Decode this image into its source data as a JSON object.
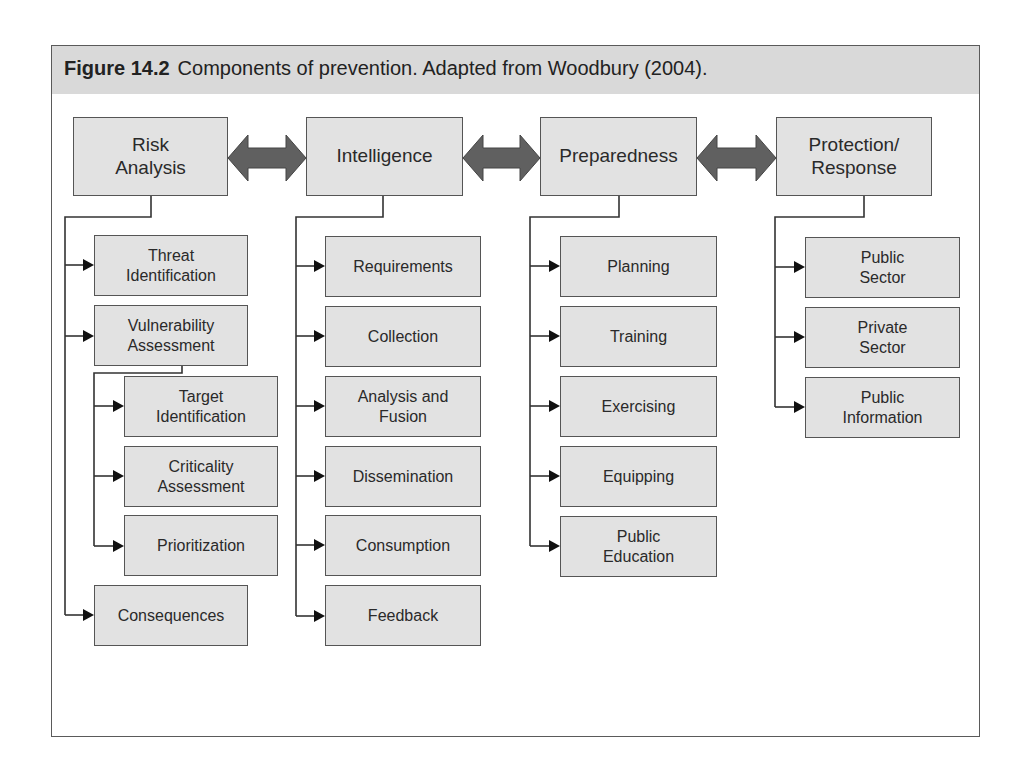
{
  "figure": {
    "number": "Figure 14.2",
    "caption": "Components of prevention. Adapted from Woodbury (2004)."
  },
  "colors": {
    "box_fill": "#e2e2e2",
    "box_border": "#555555",
    "arrow_fill": "#606060",
    "caption_band": "#d9d9d9"
  },
  "columns": [
    {
      "title": "Risk\nAnalysis",
      "children": [
        {
          "label": "Threat\nIdentification"
        },
        {
          "label": "Vulnerability\nAssessment",
          "children": [
            {
              "label": "Target\nIdentification"
            },
            {
              "label": "Criticality\nAssessment"
            },
            {
              "label": "Prioritization"
            }
          ]
        },
        {
          "label": "Consequences"
        }
      ]
    },
    {
      "title": "Intelligence",
      "children": [
        {
          "label": "Requirements"
        },
        {
          "label": "Collection"
        },
        {
          "label": "Analysis and\nFusion"
        },
        {
          "label": "Dissemination"
        },
        {
          "label": "Consumption"
        },
        {
          "label": "Feedback"
        }
      ]
    },
    {
      "title": "Preparedness",
      "children": [
        {
          "label": "Planning"
        },
        {
          "label": "Training"
        },
        {
          "label": "Exercising"
        },
        {
          "label": "Equipping"
        },
        {
          "label": "Public\nEducation"
        }
      ]
    },
    {
      "title": "Protection/\nResponse",
      "children": [
        {
          "label": "Public\nSector"
        },
        {
          "label": "Private\nSector"
        },
        {
          "label": "Public\nInformation"
        }
      ]
    }
  ],
  "links": [
    {
      "from": "Risk Analysis",
      "to": "Intelligence",
      "type": "bidirectional"
    },
    {
      "from": "Intelligence",
      "to": "Preparedness",
      "type": "bidirectional"
    },
    {
      "from": "Preparedness",
      "to": "Protection/Response",
      "type": "bidirectional"
    }
  ]
}
